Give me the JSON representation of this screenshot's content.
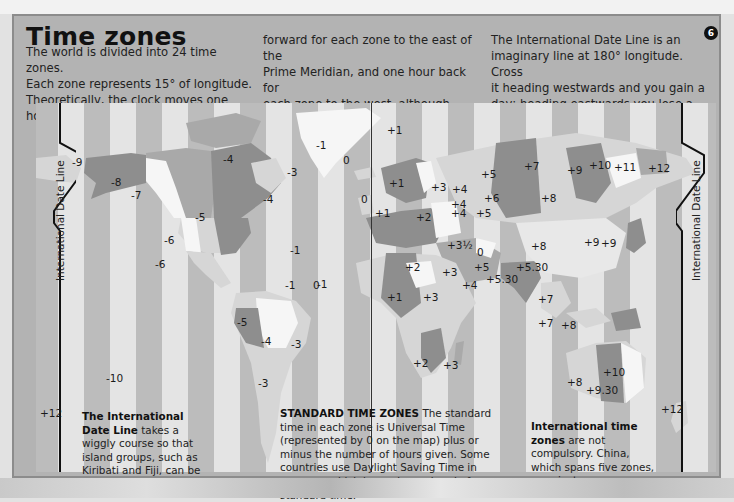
{
  "title": "Time zones",
  "page_badge": "6",
  "intro": {
    "col1": [
      "The world is divided into 24 time zones.",
      "Each zone represents 15° of longitude.",
      "Theoretically, the clock moves one hour"
    ],
    "col2": [
      "forward for each zone to the east of the",
      "Prime Meridian, and one hour back for",
      "each zone to the west, although many",
      "variations occur."
    ],
    "col3": [
      "The International Date Line is an",
      "imaginary line at 180° longitude. Cross",
      "it heading westwards and you gain a",
      "day; heading eastwards you lose a day."
    ]
  },
  "map": {
    "date_line_label": "International Date Line",
    "zone_labels": [
      {
        "text": "+12",
        "x": 14,
        "y": 115
      },
      {
        "text": "-9",
        "x": 72,
        "y": 163
      },
      {
        "text": "-8",
        "x": 111,
        "y": 183
      },
      {
        "text": "-7",
        "x": 131,
        "y": 196
      },
      {
        "text": "-4",
        "x": 223,
        "y": 160
      },
      {
        "text": "-1",
        "x": 316,
        "y": 146
      },
      {
        "text": "-3",
        "x": 287,
        "y": 173
      },
      {
        "text": "0",
        "x": 343,
        "y": 161
      },
      {
        "text": "-5",
        "x": 195,
        "y": 218
      },
      {
        "text": "-4",
        "x": 263,
        "y": 200
      },
      {
        "text": "-6",
        "x": 164,
        "y": 241
      },
      {
        "text": "-1",
        "x": 290,
        "y": 251
      },
      {
        "text": "-6",
        "x": 155,
        "y": 265
      },
      {
        "text": "-1",
        "x": 285,
        "y": 286
      },
      {
        "text": "0",
        "x": 313,
        "y": 286
      },
      {
        "text": "+1",
        "x": 387,
        "y": 131
      },
      {
        "text": "+1",
        "x": 389,
        "y": 184
      },
      {
        "text": "0",
        "x": 361,
        "y": 200
      },
      {
        "text": "+1",
        "x": 375,
        "y": 214
      },
      {
        "text": "+2",
        "x": 416,
        "y": 218
      },
      {
        "text": "+3",
        "x": 431,
        "y": 188
      },
      {
        "text": "+4",
        "x": 452,
        "y": 190
      },
      {
        "text": "+4",
        "x": 451,
        "y": 205
      },
      {
        "text": "+4",
        "x": 451,
        "y": 214
      },
      {
        "text": "+5",
        "x": 481,
        "y": 175
      },
      {
        "text": "+6",
        "x": 484,
        "y": 199
      },
      {
        "text": "+5",
        "x": 476,
        "y": 214
      },
      {
        "text": "+7",
        "x": 524,
        "y": 167
      },
      {
        "text": "+9",
        "x": 567,
        "y": 171
      },
      {
        "text": "+10",
        "x": 589,
        "y": 166
      },
      {
        "text": "+11",
        "x": 614,
        "y": 168
      },
      {
        "text": "+12",
        "x": 648,
        "y": 169
      },
      {
        "text": "+8",
        "x": 541,
        "y": 199
      },
      {
        "text": "+3½",
        "x": 447,
        "y": 246
      },
      {
        "text": "0",
        "x": 477,
        "y": 253
      },
      {
        "text": "+5",
        "x": 474,
        "y": 268
      },
      {
        "text": "+8",
        "x": 531,
        "y": 247
      },
      {
        "text": "+9",
        "x": 584,
        "y": 243
      },
      {
        "text": "+9",
        "x": 601,
        "y": 244
      },
      {
        "text": "-1",
        "x": 317,
        "y": 285
      },
      {
        "text": "+2",
        "x": 405,
        "y": 268
      },
      {
        "text": "+3",
        "x": 442,
        "y": 273
      },
      {
        "text": "+5.30",
        "x": 516,
        "y": 268
      },
      {
        "text": "+5.30",
        "x": 486,
        "y": 280
      },
      {
        "text": "+4",
        "x": 462,
        "y": 286
      },
      {
        "text": "+1",
        "x": 387,
        "y": 298
      },
      {
        "text": "+3",
        "x": 423,
        "y": 298
      },
      {
        "text": "+7",
        "x": 538,
        "y": 300
      },
      {
        "text": "-5",
        "x": 237,
        "y": 323
      },
      {
        "text": "-4",
        "x": 261,
        "y": 342
      },
      {
        "text": "-3",
        "x": 291,
        "y": 345
      },
      {
        "text": "+7",
        "x": 538,
        "y": 324
      },
      {
        "text": "+8",
        "x": 561,
        "y": 326
      },
      {
        "text": "-3",
        "x": 258,
        "y": 384
      },
      {
        "text": "+2",
        "x": 413,
        "y": 364
      },
      {
        "text": "+3",
        "x": 443,
        "y": 366
      },
      {
        "text": "-10",
        "x": 106,
        "y": 379
      },
      {
        "text": "+10",
        "x": 603,
        "y": 373
      },
      {
        "text": "+8",
        "x": 567,
        "y": 383
      },
      {
        "text": "+9.30",
        "x": 586,
        "y": 391
      },
      {
        "text": "+12",
        "x": 40,
        "y": 414
      },
      {
        "text": "+12",
        "x": 661,
        "y": 410
      }
    ]
  },
  "notes": {
    "idl": {
      "bold": "The International Date Line",
      "rest": " takes a wiggly course so that island groups, such as Kiribati and Fiji, can be in one zone."
    },
    "standard": {
      "bold": "STANDARD TIME ZONES",
      "rest": "  The standard time in each zone is Universal Time (represented by 0 on the map) plus or minus the number of hours given. Some countries use Daylight Saving Time in summer, which is one hour ahead of standard time."
    },
    "international": {
      "bold": "International time zones",
      "rest": " are not compulsory. China, which spans five zones, uses just one."
    }
  },
  "colors": {
    "panel": "#b3b3b3",
    "stripe_light": "#e4e4e4",
    "stripe_dark": "#bcbcbc",
    "land_dark": "#8e8e8e",
    "land_mid": "#a9a9a9",
    "land_light": "#d6d6d6",
    "land_white": "#f6f6f6"
  }
}
